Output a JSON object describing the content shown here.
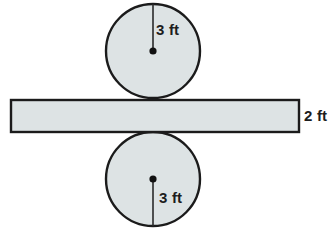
{
  "figure": {
    "background_color": "#ffffff",
    "fill_color": "#dde3e4",
    "stroke_color": "#1b1b1b",
    "labels": {
      "top_circle_radius": "3 ft",
      "bottom_circle_radius": "3 ft",
      "bar_height": "2 ft"
    },
    "top_circle": {
      "center_x": 153,
      "center_y": 51,
      "radius": 47,
      "radius_label": "3 ft"
    },
    "bottom_circle": {
      "center_x": 153,
      "center_y": 179,
      "radius": 47,
      "radius_label": "3 ft"
    },
    "bar": {
      "x": 11,
      "y": 100,
      "width": 288,
      "height": 32,
      "height_label": "2 ft"
    }
  }
}
